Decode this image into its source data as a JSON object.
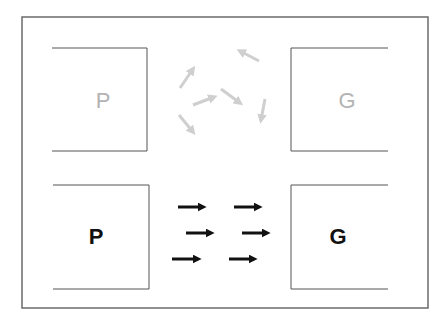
{
  "diagram": {
    "frame": {
      "stroke": "#6b6b6b"
    },
    "top_row": {
      "state": "disordered",
      "left_box": {
        "label": "P",
        "color": "#b3b3b3"
      },
      "right_box": {
        "label": "G",
        "color": "#b3b3b3"
      },
      "arrow_color": "#cfcfcf",
      "arrows": [
        {
          "x1": 180,
          "y1": 88,
          "x2": 193,
          "y2": 69
        },
        {
          "x1": 193,
          "y1": 105,
          "x2": 214,
          "y2": 97
        },
        {
          "x1": 179,
          "y1": 115,
          "x2": 193,
          "y2": 132
        },
        {
          "x1": 221,
          "y1": 89,
          "x2": 240,
          "y2": 103
        },
        {
          "x1": 259,
          "y1": 61,
          "x2": 240,
          "y2": 51
        },
        {
          "x1": 265,
          "y1": 99,
          "x2": 261,
          "y2": 120
        }
      ]
    },
    "bottom_row": {
      "state": "aligned",
      "left_box": {
        "label": "P",
        "color": "#111111"
      },
      "right_box": {
        "label": "G",
        "color": "#111111"
      },
      "arrow_color": "#111111",
      "arrows": [
        {
          "x1": 178,
          "y1": 207,
          "x2": 203,
          "y2": 207
        },
        {
          "x1": 234,
          "y1": 207,
          "x2": 259,
          "y2": 207
        },
        {
          "x1": 186,
          "y1": 233,
          "x2": 211,
          "y2": 233
        },
        {
          "x1": 242,
          "y1": 233,
          "x2": 267,
          "y2": 233
        },
        {
          "x1": 172,
          "y1": 259,
          "x2": 198,
          "y2": 259
        },
        {
          "x1": 229,
          "y1": 259,
          "x2": 254,
          "y2": 259
        }
      ]
    }
  }
}
